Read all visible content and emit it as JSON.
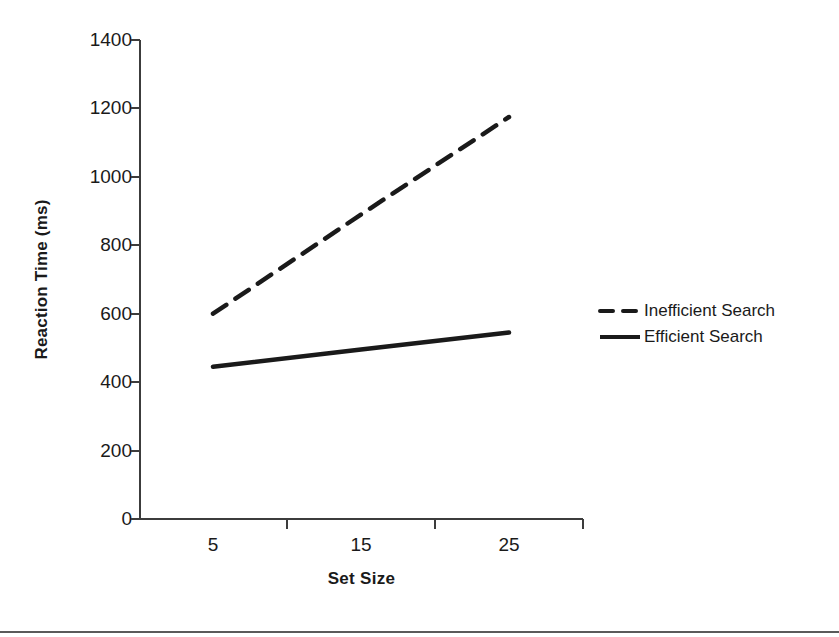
{
  "chart_data": {
    "type": "line",
    "title": "",
    "xlabel": "Set Size",
    "ylabel": "Reaction Time (ms)",
    "categories": [
      "5",
      "15",
      "25"
    ],
    "x": [
      5,
      15,
      25
    ],
    "xtick_labels": [
      "5",
      "15",
      "25"
    ],
    "ytick_labels": [
      "0",
      "200",
      "400",
      "600",
      "800",
      "1000",
      "1200",
      "1400"
    ],
    "yticks": [
      0,
      200,
      400,
      600,
      800,
      1000,
      1200,
      1400
    ],
    "ylim": [
      0,
      1400
    ],
    "ylabel_unit": "ms",
    "grid": false,
    "legend_position": "right",
    "series": [
      {
        "name": "Inefficient Search",
        "style": "dashed",
        "color": "#1a1a1a",
        "values": [
          600,
          890,
          1175
        ]
      },
      {
        "name": "Efficient Search",
        "style": "solid",
        "color": "#1a1a1a",
        "values": [
          445,
          495,
          545
        ]
      }
    ]
  },
  "legend": {
    "entries": [
      {
        "label": "Inefficient Search",
        "style": "dashed"
      },
      {
        "label": "Efficient Search",
        "style": "solid"
      }
    ]
  },
  "colors": {
    "line": "#1a1a1a",
    "axis": "#3c3c3c",
    "rule": "#5a5a5a",
    "background": "#ffffff"
  }
}
